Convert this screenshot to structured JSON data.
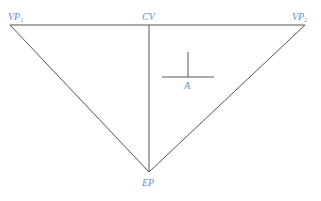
{
  "diagram": {
    "colors": {
      "line": "#555555",
      "label": "#5b8fd0",
      "background": "#ffffff"
    },
    "points": {
      "vp1": {
        "label": "VP",
        "sub": "1",
        "x": 10,
        "y": 25
      },
      "cv": {
        "label": "CV",
        "x": 149,
        "y": 25
      },
      "vp2": {
        "label": "VP",
        "sub": "2",
        "x": 305,
        "y": 25
      },
      "ep": {
        "label": "EP",
        "x": 149,
        "y": 172
      },
      "a": {
        "label": "A",
        "x": 188,
        "y": 77
      }
    },
    "lines": [
      {
        "name": "horizon-line",
        "x1": 10,
        "y1": 25,
        "x2": 305,
        "y2": 25
      },
      {
        "name": "vp1-to-ep-line",
        "x1": 10,
        "y1": 25,
        "x2": 149,
        "y2": 172
      },
      {
        "name": "vp2-to-ep-line",
        "x1": 305,
        "y1": 25,
        "x2": 149,
        "y2": 172
      },
      {
        "name": "cv-to-ep-line",
        "x1": 149,
        "y1": 25,
        "x2": 149,
        "y2": 172
      },
      {
        "name": "a-vertical-line",
        "x1": 188,
        "y1": 52,
        "x2": 188,
        "y2": 77
      },
      {
        "name": "a-horizontal-line",
        "x1": 162,
        "y1": 77,
        "x2": 214,
        "y2": 77
      }
    ]
  }
}
